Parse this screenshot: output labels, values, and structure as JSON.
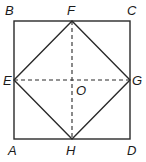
{
  "diagram": {
    "type": "geometry",
    "colors": {
      "line": "#2a2a2a",
      "label": "#1a1a1a",
      "background": "#ffffff"
    },
    "points": {
      "A": {
        "label": "A",
        "x": 14,
        "y": 139
      },
      "B": {
        "label": "B",
        "x": 14,
        "y": 21
      },
      "C": {
        "label": "C",
        "x": 130,
        "y": 21
      },
      "D": {
        "label": "D",
        "x": 130,
        "y": 139
      },
      "E": {
        "label": "E",
        "x": 14,
        "y": 80
      },
      "F": {
        "label": "F",
        "x": 72,
        "y": 21
      },
      "G": {
        "label": "G",
        "x": 130,
        "y": 80
      },
      "H": {
        "label": "H",
        "x": 72,
        "y": 139
      },
      "O": {
        "label": "O",
        "x": 72,
        "y": 80
      }
    },
    "segments": [
      {
        "from": "A",
        "to": "B",
        "style": "solid"
      },
      {
        "from": "B",
        "to": "C",
        "style": "solid"
      },
      {
        "from": "C",
        "to": "D",
        "style": "solid"
      },
      {
        "from": "D",
        "to": "A",
        "style": "solid"
      },
      {
        "from": "E",
        "to": "F",
        "style": "solid"
      },
      {
        "from": "F",
        "to": "G",
        "style": "solid"
      },
      {
        "from": "G",
        "to": "H",
        "style": "solid"
      },
      {
        "from": "H",
        "to": "E",
        "style": "solid"
      },
      {
        "from": "E",
        "to": "G",
        "style": "dashed"
      },
      {
        "from": "F",
        "to": "H",
        "style": "dashed"
      }
    ]
  }
}
